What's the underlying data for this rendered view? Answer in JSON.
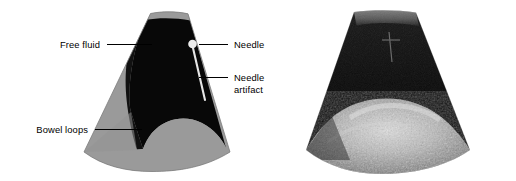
{
  "figure": {
    "panels": [
      {
        "id": "schematic",
        "kind": "line-drawing-schematic",
        "caption": "Labeled schematic of the ultrasound sector image"
      },
      {
        "id": "ultrasound",
        "kind": "grayscale-ultrasound-photograph",
        "caption": "Corresponding real B-mode ultrasound sector image"
      }
    ]
  },
  "labels": [
    {
      "key": "free_fluid",
      "text": "Free fluid",
      "text2": ""
    },
    {
      "key": "needle",
      "text": "Needle",
      "text2": ""
    },
    {
      "key": "needle_artifact",
      "text": "Needle",
      "text2": "artifact"
    },
    {
      "key": "bowel_loops",
      "text": "Bowel loops",
      "text2": ""
    }
  ],
  "anatomy": [
    {
      "key": "near_field_band",
      "name": "near field tissue band",
      "tone": "#9a9a9a"
    },
    {
      "key": "free_fluid_region",
      "name": "anechoic free fluid",
      "tone": "#0a0a0a"
    },
    {
      "key": "bowel_region",
      "name": "echogenic bowel loops",
      "tone": "#9a9a9a"
    },
    {
      "key": "needle_tip",
      "name": "needle tip echo",
      "tone": "#e8e8e8"
    },
    {
      "key": "needle_artifact_line",
      "name": "needle reverberation artifact",
      "tone": "#e0e0e0"
    }
  ],
  "colors": {
    "background": "#ffffff",
    "fluid_black": "#080808",
    "tissue_gray": "#9a9a9a",
    "tissue_gray_dark": "#8b8b8b",
    "needle_white": "#ededed",
    "leader_line": "#000000",
    "text": "#000000"
  }
}
